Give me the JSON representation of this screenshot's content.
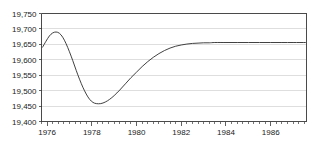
{
  "chart_data": {
    "type": "line",
    "title": "",
    "subtitle": "",
    "xlabel": "",
    "ylabel": "",
    "xlim": [
      1975.75,
      1987.6
    ],
    "ylim": [
      19400,
      19750
    ],
    "grid": true,
    "legend": null,
    "y_ticks": [
      19400,
      19450,
      19500,
      19550,
      19600,
      19650,
      19700,
      19750
    ],
    "y_tick_labels": [
      "19,400",
      "19,450",
      "19,500",
      "19,550",
      "19,600",
      "19,650",
      "19,700",
      "19,750"
    ],
    "x_ticks": [
      1976,
      1978,
      1980,
      1982,
      1984,
      1986
    ],
    "x_tick_labels": [
      "1976",
      "1978",
      "1980",
      "1982",
      "1984",
      "1986"
    ],
    "x_minor_interval": 0.25,
    "line_color": "#2b2b2b",
    "grid_color": "#c8c8c8",
    "frame_color": "#4a4a4a",
    "background_color": "#ffffff",
    "series": [
      {
        "name": "series-1",
        "x": [
          1975.8,
          1975.95,
          1976.1,
          1976.25,
          1976.4,
          1976.55,
          1976.7,
          1976.85,
          1977.0,
          1977.15,
          1977.3,
          1977.45,
          1977.6,
          1977.75,
          1977.9,
          1978.05,
          1978.2,
          1978.4,
          1978.6,
          1978.8,
          1979.0,
          1979.25,
          1979.5,
          1979.75,
          1980.0,
          1980.25,
          1980.5,
          1980.75,
          1981.0,
          1981.25,
          1981.5,
          1981.75,
          1982.0,
          1982.25,
          1982.5,
          1982.75,
          1983.0,
          1983.25,
          1983.5,
          1984.0,
          1984.5,
          1985.0,
          1985.5,
          1986.0,
          1986.5,
          1987.0,
          1987.55
        ],
        "y": [
          19641,
          19660,
          19677,
          19687,
          19690,
          19686,
          19673,
          19652,
          19626,
          19597,
          19566,
          19537,
          19511,
          19489,
          19472,
          19462,
          19458,
          19458,
          19463,
          19472,
          19484,
          19502,
          19522,
          19542,
          19560,
          19578,
          19594,
          19608,
          19620,
          19630,
          19638,
          19644,
          19648,
          19651,
          19653,
          19654,
          19655,
          19655,
          19656,
          19656,
          19656,
          19656,
          19656,
          19656,
          19656,
          19656,
          19656
        ]
      }
    ]
  }
}
